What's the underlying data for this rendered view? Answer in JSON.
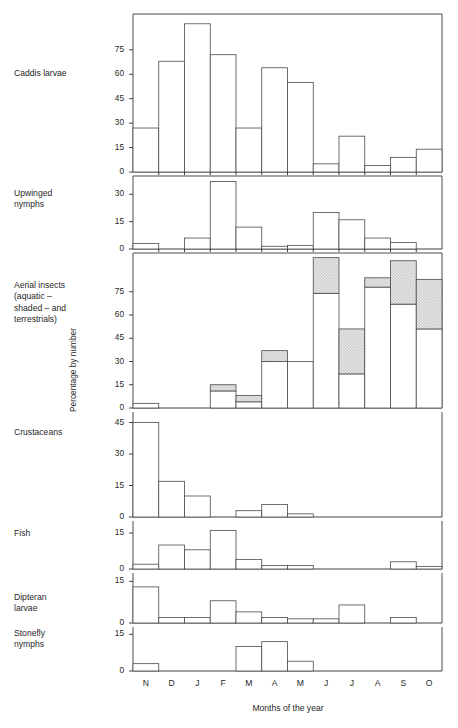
{
  "chart_data": {
    "type": "bar",
    "title": "",
    "xlabel": "Months of the year",
    "ylabel": "Percentage by number",
    "grid": false,
    "legend": "none",
    "categories": [
      "N",
      "D",
      "J",
      "F",
      "M",
      "A",
      "M",
      "J",
      "J",
      "A",
      "S",
      "O"
    ],
    "panels": [
      {
        "name": "Caddis larvae",
        "label": "Caddis larvae",
        "yticks": [
          0,
          15,
          30,
          45,
          60,
          75
        ],
        "ylim": [
          0,
          97
        ],
        "values": [
          27,
          68,
          91,
          72,
          27,
          64,
          55,
          5,
          22,
          4,
          9,
          14
        ]
      },
      {
        "name": "Upwinged nymphs",
        "label": "Upwinged\nnymphs",
        "yticks": [
          0,
          15,
          30
        ],
        "ylim": [
          0,
          40
        ],
        "values": [
          3,
          0,
          6,
          37,
          12,
          1.5,
          2,
          20,
          16,
          6,
          3.5,
          0
        ]
      },
      {
        "name": "Aerial insects",
        "label": "Aerial insects\n(aquatic –\nshaded – and\nterrestrials)",
        "yticks": [
          0,
          15,
          30,
          45,
          60,
          75
        ],
        "ylim": [
          0,
          100
        ],
        "values": [
          3,
          0,
          0,
          15,
          8,
          37,
          30,
          97,
          51,
          84,
          95,
          83
        ],
        "series": [
          {
            "name": "terrestrials (unshaded lower)",
            "values": [
              3,
              0,
              0,
              11,
              4,
              30,
              30,
              74,
              22,
              78,
              67,
              51
            ]
          },
          {
            "name": "aquatic (shaded upper)",
            "values": [
              0,
              0,
              0,
              4,
              4,
              7,
              0,
              23,
              29,
              6,
              28,
              32
            ]
          }
        ]
      },
      {
        "name": "Crustaceans",
        "label": "Crustaceans",
        "yticks": [
          0,
          15,
          30,
          45
        ],
        "ylim": [
          0,
          50
        ],
        "values": [
          45,
          17,
          10,
          0,
          3,
          6,
          1.5,
          0,
          0,
          0,
          0,
          0
        ]
      },
      {
        "name": "Fish",
        "label": "Fish",
        "yticks": [
          0,
          15
        ],
        "ylim": [
          0,
          20
        ],
        "values": [
          2,
          10,
          8,
          16,
          4,
          1.5,
          1.5,
          0,
          0,
          0,
          3,
          1
        ]
      },
      {
        "name": "Dipteran larvae",
        "label": "Dipteran\nlarvae",
        "yticks": [
          0,
          15
        ],
        "ylim": [
          0,
          18
        ],
        "values": [
          13,
          2,
          2,
          8,
          4,
          2,
          1.5,
          1.5,
          6.5,
          0,
          2,
          0
        ]
      },
      {
        "name": "Stonefly nymphs",
        "label": "Stonefly\nnymphs",
        "yticks": [
          0,
          15
        ],
        "ylim": [
          0,
          18
        ],
        "values": [
          3,
          0,
          0,
          0,
          10,
          12,
          4,
          0,
          0,
          0,
          0,
          0
        ]
      }
    ],
    "colors": {
      "bar_fill": "#ffffff",
      "bar_stroke": "#4a4a4a",
      "shaded_fill": "#d9d9d9",
      "axis": "#2b2b2b",
      "text": "#1f1f1f"
    }
  }
}
